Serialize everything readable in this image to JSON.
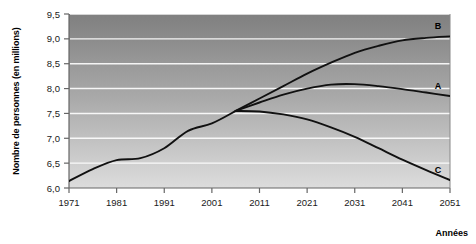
{
  "chart_data": {
    "type": "line",
    "title": "",
    "xlabel": "Années",
    "ylabel": "Nombre de personnes (en millions)",
    "xlim": [
      1971,
      2051
    ],
    "ylim": [
      6.0,
      9.5
    ],
    "grid": true,
    "legend_position": "inline-right-of-curve-ends",
    "y_ticks": [
      "6,0",
      "6,5",
      "7,0",
      "7,5",
      "8,0",
      "8,5",
      "9,0",
      "9,5"
    ],
    "y_tick_values": [
      6.0,
      6.5,
      7.0,
      7.5,
      8.0,
      8.5,
      9.0,
      9.5
    ],
    "x_ticks": [
      "1971",
      "1981",
      "1991",
      "2001",
      "2011",
      "2021",
      "2031",
      "2041",
      "2051"
    ],
    "x_tick_values": [
      1971,
      1981,
      1991,
      2001,
      2011,
      2021,
      2031,
      2041,
      2051
    ],
    "series": [
      {
        "name": "Historique",
        "label": "",
        "x": [
          1971,
          1976,
          1981,
          1986,
          1991,
          1996,
          2001,
          2006
        ],
        "values": [
          6.14,
          6.38,
          6.56,
          6.6,
          6.8,
          7.15,
          7.3,
          7.55
        ]
      },
      {
        "name": "B",
        "label": "B",
        "x": [
          2006,
          2011,
          2016,
          2021,
          2026,
          2031,
          2036,
          2041,
          2046,
          2051
        ],
        "values": [
          7.55,
          7.8,
          8.05,
          8.3,
          8.52,
          8.72,
          8.86,
          8.97,
          9.02,
          9.05
        ]
      },
      {
        "name": "A",
        "label": "A",
        "x": [
          2006,
          2011,
          2016,
          2021,
          2026,
          2031,
          2036,
          2041,
          2046,
          2051
        ],
        "values": [
          7.55,
          7.72,
          7.88,
          8.0,
          8.08,
          8.09,
          8.05,
          7.99,
          7.92,
          7.85
        ]
      },
      {
        "name": "C",
        "label": "C",
        "x": [
          2006,
          2011,
          2016,
          2021,
          2026,
          2031,
          2036,
          2041,
          2046,
          2051
        ],
        "values": [
          7.55,
          7.54,
          7.48,
          7.38,
          7.22,
          7.03,
          6.8,
          6.57,
          6.36,
          6.16
        ]
      }
    ],
    "colors": {
      "line": "#111111",
      "gridline": "#ffffff",
      "plot_bg_top": "#8a8a8a",
      "plot_bg_bottom": "#d8d8d8",
      "axis": "#555555",
      "text": "#000000"
    }
  }
}
